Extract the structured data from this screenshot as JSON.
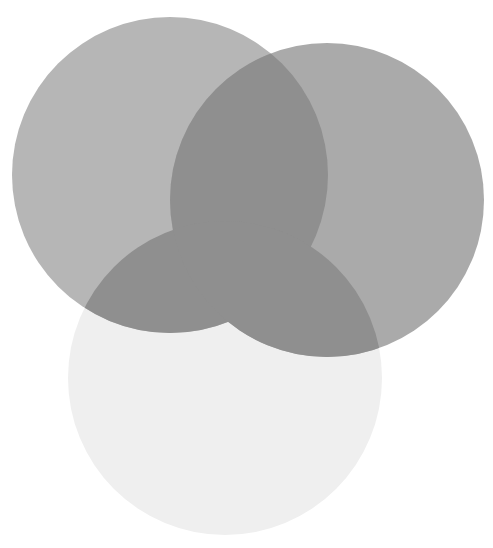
{
  "diagram": {
    "type": "venn",
    "set_count": 3,
    "sets": [
      {
        "id": "A",
        "name": "top-left-circle",
        "color": "#b6b6b6"
      },
      {
        "id": "B",
        "name": "top-right-circle",
        "color": "#aaaaaa"
      },
      {
        "id": "C",
        "name": "bottom-circle",
        "color": "#efefef"
      }
    ],
    "overlap_color": "#8f8f8f",
    "background_color": "#ffffff",
    "labels": []
  }
}
